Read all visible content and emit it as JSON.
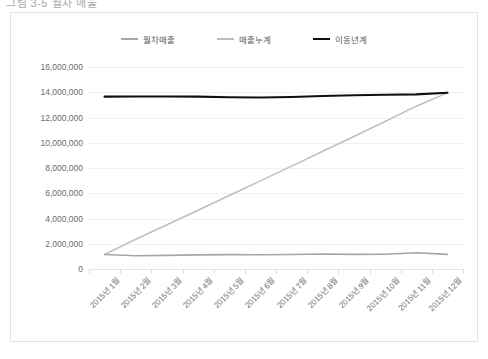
{
  "document": {
    "title_fragment": "그림 3-5 월차 매출"
  },
  "chart_data": {
    "type": "line",
    "title": "",
    "xlabel": "",
    "ylabel": "",
    "ylim": [
      0,
      16000000
    ],
    "ytick_step": 2000000,
    "grid": true,
    "legend_position": "top",
    "categories": [
      "2015년 1월",
      "2015년 2월",
      "2015년 3월",
      "2015년 4월",
      "2015년 5월",
      "2015년 6월",
      "2015년 7월",
      "2015년 8월",
      "2015년 9월",
      "2015년 10월",
      "2015년 11월",
      "2015년 12월"
    ],
    "ytick_labels": [
      "16,000,000",
      "14,000,000",
      "12,000,000",
      "10,000,000",
      "8,000,000",
      "6,000,000",
      "4,000,000",
      "2,000,000",
      "0"
    ],
    "series": [
      {
        "name": "월차매출",
        "color": "#a6a6a6",
        "width": 1.6,
        "values": [
          1150000,
          1050000,
          1080000,
          1120000,
          1140000,
          1130000,
          1150000,
          1190000,
          1160000,
          1170000,
          1290000,
          1160000
        ]
      },
      {
        "name": "매출누계",
        "color": "#bfbfbf",
        "width": 1.6,
        "values": [
          1150000,
          2350000,
          3500000,
          4650000,
          5820000,
          6980000,
          8150000,
          9330000,
          10500000,
          11680000,
          12900000,
          13950000
        ]
      },
      {
        "name": "이동년계",
        "color": "#101010",
        "width": 2.1,
        "values": [
          13650000,
          13660000,
          13660000,
          13650000,
          13600000,
          13580000,
          13620000,
          13700000,
          13760000,
          13800000,
          13830000,
          13960000
        ]
      }
    ]
  }
}
